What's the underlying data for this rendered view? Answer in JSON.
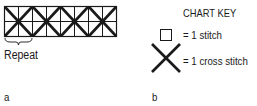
{
  "panel_a": {
    "grid": {
      "columns": 8,
      "rows": 2,
      "crosses": 4,
      "cross_span_cells": 2
    },
    "repeat_label": "Repeat",
    "caption": "a"
  },
  "panel_b": {
    "title": "CHART KEY",
    "items": [
      {
        "symbol": "square-icon",
        "label": "= 1 stitch"
      },
      {
        "symbol": "cross-icon",
        "label": "= 1 cross stitch"
      }
    ],
    "caption": "b"
  },
  "colors": {
    "ink": "#1a1a1a",
    "background": "#ffffff"
  }
}
